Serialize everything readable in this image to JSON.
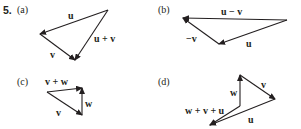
{
  "problem_number": "5.",
  "stroke_color": "#231f20",
  "panels": [
    {
      "id": "a",
      "label": "(a)",
      "vectors": [
        {
          "name": "u",
          "label": "u",
          "from": [
            108,
            10
          ],
          "to": [
            40,
            34
          ]
        },
        {
          "name": "v",
          "label": "v",
          "from": [
            40,
            34
          ],
          "to": [
            75,
            60
          ]
        },
        {
          "name": "u+v",
          "label": "u + v",
          "from": [
            108,
            10
          ],
          "to": [
            75,
            60
          ]
        }
      ]
    },
    {
      "id": "b",
      "label": "(b)",
      "vectors": [
        {
          "name": "u",
          "label": "u",
          "from": [
            287,
            20
          ],
          "to": [
            219,
            44
          ]
        },
        {
          "name": "-v",
          "label": "−v",
          "from": [
            219,
            44
          ],
          "to": [
            183,
            18
          ]
        },
        {
          "name": "u-v",
          "label": "u − v",
          "from": [
            287,
            20
          ],
          "to": [
            183,
            18
          ]
        }
      ]
    },
    {
      "id": "c",
      "label": "(c)",
      "vectors": [
        {
          "name": "v",
          "label": "v",
          "from": [
            47,
            92
          ],
          "to": [
            82,
            115
          ]
        },
        {
          "name": "w",
          "label": "w",
          "from": [
            82,
            115
          ],
          "to": [
            82,
            88
          ]
        },
        {
          "name": "v+w",
          "label": "v + w",
          "from": [
            47,
            92
          ],
          "to": [
            82,
            88
          ]
        }
      ]
    },
    {
      "id": "d",
      "label": "(d)",
      "vectors": [
        {
          "name": "w",
          "label": "w",
          "from": [
            240,
            106
          ],
          "to": [
            240,
            75
          ]
        },
        {
          "name": "v",
          "label": "v",
          "from": [
            240,
            75
          ],
          "to": [
            275,
            99
          ]
        },
        {
          "name": "u",
          "label": "u",
          "from": [
            275,
            99
          ],
          "to": [
            210,
            125
          ]
        },
        {
          "name": "w+v+u",
          "label": "w + v + u",
          "from": [
            240,
            106
          ],
          "to": [
            210,
            125
          ]
        }
      ]
    }
  ]
}
